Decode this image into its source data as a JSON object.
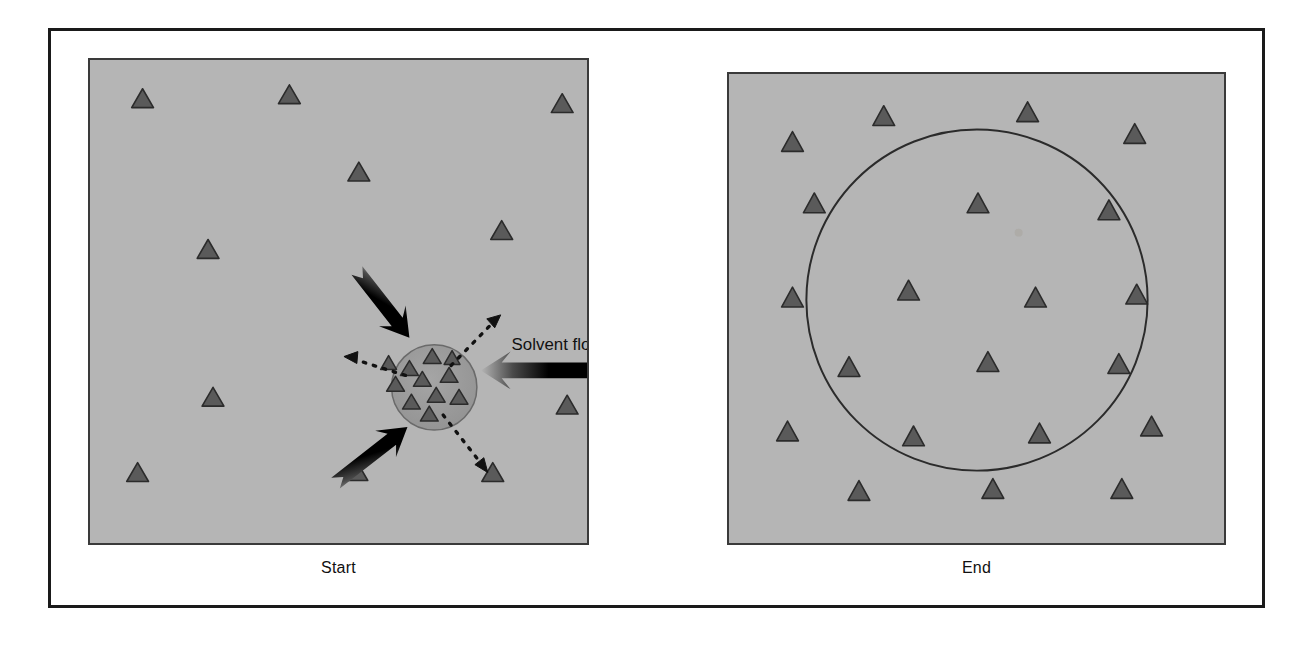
{
  "figure": {
    "type": "two-panel-scientific-diagram",
    "background_color": "#ffffff",
    "frame_color": "#1a1a1a",
    "panel_fill": "#b5b5b5",
    "panel_border": "#3a3a3a",
    "triangle_fill": "#5a5a5a",
    "triangle_stroke": "#2b2b2b",
    "arrow_color": "#000000",
    "circle_fill": "#9a9a9a",
    "circle_outline": "#3a3a3a"
  },
  "panels": [
    {
      "id": "start",
      "caption": "Start",
      "caption_label": "Start",
      "x": 88,
      "y": 58,
      "width": 501,
      "height": 487,
      "analyte_zone": {
        "shape": "filled-circle",
        "cx": 347,
        "cy": 330,
        "r": 43,
        "fill": "#9a9a9a",
        "triangles_inside": 11
      },
      "outer_triangles": [
        {
          "x": 42,
          "y": 48,
          "size": 20
        },
        {
          "x": 190,
          "y": 44,
          "size": 20
        },
        {
          "x": 465,
          "y": 53,
          "size": 20
        },
        {
          "x": 260,
          "y": 122,
          "size": 20
        },
        {
          "x": 404,
          "y": 181,
          "size": 20
        },
        {
          "x": 108,
          "y": 200,
          "size": 20
        },
        {
          "x": 113,
          "y": 349,
          "size": 20
        },
        {
          "x": 330,
          "y": 361,
          "size": 20
        },
        {
          "x": 470,
          "y": 357,
          "size": 20
        },
        {
          "x": 37,
          "y": 425,
          "size": 20
        },
        {
          "x": 258,
          "y": 424,
          "size": 20
        },
        {
          "x": 395,
          "y": 425,
          "size": 20
        }
      ],
      "cluster_triangles": [
        {
          "x": 343,
          "y": 299,
          "size": 17
        },
        {
          "x": 320,
          "y": 311,
          "size": 17
        },
        {
          "x": 306,
          "y": 327,
          "size": 17
        },
        {
          "x": 333,
          "y": 322,
          "size": 17
        },
        {
          "x": 360,
          "y": 318,
          "size": 17
        },
        {
          "x": 347,
          "y": 338,
          "size": 17
        },
        {
          "x": 322,
          "y": 345,
          "size": 17
        },
        {
          "x": 370,
          "y": 340,
          "size": 17
        },
        {
          "x": 340,
          "y": 357,
          "size": 17
        },
        {
          "x": 363,
          "y": 300,
          "size": 15
        },
        {
          "x": 300,
          "y": 305,
          "size": 15
        }
      ],
      "solid_arrows": [
        {
          "name": "solvent-flow-arrow-top-left",
          "from": [
            243,
            178
          ],
          "to": [
            320,
            278
          ],
          "direction": "down-right"
        },
        {
          "name": "solvent-flow-arrow-right",
          "from": [
            520,
            313
          ],
          "to": [
            396,
            313
          ],
          "direction": "left"
        },
        {
          "name": "solvent-flow-arrow-bottom-left",
          "from": [
            240,
            432
          ],
          "to": [
            318,
            372
          ],
          "direction": "up-right"
        }
      ],
      "dotted_arrows": [
        {
          "name": "dispersion-arrow-up-right",
          "from": [
            364,
            308
          ],
          "to": [
            410,
            263
          ],
          "direction": "up-right"
        },
        {
          "name": "dispersion-arrow-left",
          "from": [
            315,
            318
          ],
          "to": [
            258,
            300
          ],
          "direction": "left"
        },
        {
          "name": "dispersion-arrow-down-right",
          "from": [
            357,
            360
          ],
          "to": [
            400,
            412
          ],
          "direction": "down-right"
        }
      ],
      "annotation": {
        "text": "Solvent flow",
        "x": 425,
        "y": 292,
        "font_size": 17
      }
    },
    {
      "id": "end",
      "caption": "End",
      "caption_label": "End",
      "x": 727,
      "y": 72,
      "width": 499,
      "height": 473,
      "dispersed_zone": {
        "shape": "circle-outline",
        "cx": 250,
        "cy": 228,
        "r": 172,
        "stroke": "#2b2b2b",
        "stroke_width": 2
      },
      "triangles": [
        {
          "x": 145,
          "y": 52,
          "size": 21
        },
        {
          "x": 290,
          "y": 48,
          "size": 21
        },
        {
          "x": 53,
          "y": 78,
          "size": 21
        },
        {
          "x": 398,
          "y": 70,
          "size": 21
        },
        {
          "x": 75,
          "y": 140,
          "size": 21
        },
        {
          "x": 240,
          "y": 140,
          "size": 21
        },
        {
          "x": 372,
          "y": 147,
          "size": 21
        },
        {
          "x": 53,
          "y": 235,
          "size": 21
        },
        {
          "x": 170,
          "y": 228,
          "size": 21
        },
        {
          "x": 298,
          "y": 235,
          "size": 21
        },
        {
          "x": 400,
          "y": 232,
          "size": 21
        },
        {
          "x": 110,
          "y": 305,
          "size": 21
        },
        {
          "x": 250,
          "y": 300,
          "size": 21
        },
        {
          "x": 382,
          "y": 302,
          "size": 21
        },
        {
          "x": 48,
          "y": 370,
          "size": 21
        },
        {
          "x": 175,
          "y": 375,
          "size": 21
        },
        {
          "x": 302,
          "y": 372,
          "size": 21
        },
        {
          "x": 415,
          "y": 365,
          "size": 21
        },
        {
          "x": 120,
          "y": 430,
          "size": 21
        },
        {
          "x": 255,
          "y": 428,
          "size": 21
        },
        {
          "x": 385,
          "y": 428,
          "size": 21
        }
      ]
    }
  ]
}
